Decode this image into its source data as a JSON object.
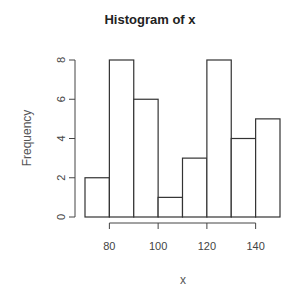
{
  "chart_data": {
    "type": "bar",
    "subtype": "histogram",
    "title": "Histogram of x",
    "xlabel": "x",
    "ylabel": "Frequency",
    "bin_edges": [
      70,
      80,
      90,
      100,
      110,
      120,
      130,
      140,
      150
    ],
    "categories": [
      "70-80",
      "80-90",
      "90-100",
      "100-110",
      "110-120",
      "120-130",
      "130-140",
      "140-150"
    ],
    "values": [
      2,
      8,
      6,
      1,
      3,
      8,
      4,
      5
    ],
    "xlim": [
      70,
      150
    ],
    "ylim": [
      0,
      8
    ],
    "x_ticks": [
      80,
      100,
      120,
      140
    ],
    "y_ticks": [
      0,
      2,
      4,
      6,
      8
    ],
    "grid": false,
    "legend": null,
    "bar_fill": "#ffffff",
    "bar_stroke": "#333333"
  }
}
